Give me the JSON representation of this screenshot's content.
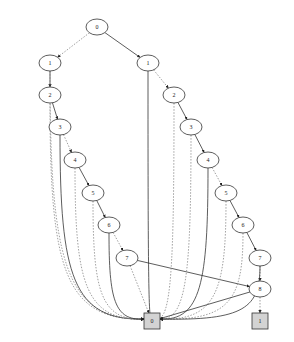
{
  "diagram": {
    "type": "binary-decision-diagram",
    "colors": {
      "edge": "#333333",
      "dashed_edge": "#888888",
      "node_stroke": "#333333",
      "node_fill": "#ffffff",
      "terminal_fill": "#d3d3d3"
    },
    "nodes": [
      {
        "id": "n0",
        "label": "0",
        "x": 97,
        "y": 27,
        "shape": "ellipse"
      },
      {
        "id": "a1",
        "label": "1",
        "x": 50,
        "y": 63,
        "shape": "ellipse"
      },
      {
        "id": "a2",
        "label": "2",
        "x": 50,
        "y": 95,
        "shape": "ellipse"
      },
      {
        "id": "a3",
        "label": "3",
        "x": 60,
        "y": 127,
        "shape": "ellipse"
      },
      {
        "id": "a4",
        "label": "4",
        "x": 75,
        "y": 160,
        "shape": "ellipse"
      },
      {
        "id": "a5",
        "label": "5",
        "x": 93,
        "y": 193,
        "shape": "ellipse"
      },
      {
        "id": "a6",
        "label": "6",
        "x": 109,
        "y": 225,
        "shape": "ellipse"
      },
      {
        "id": "a7",
        "label": "7",
        "x": 127,
        "y": 258,
        "shape": "ellipse"
      },
      {
        "id": "b1",
        "label": "1",
        "x": 148,
        "y": 63,
        "shape": "ellipse"
      },
      {
        "id": "b2",
        "label": "2",
        "x": 174,
        "y": 95,
        "shape": "ellipse"
      },
      {
        "id": "b3",
        "label": "3",
        "x": 191,
        "y": 127,
        "shape": "ellipse"
      },
      {
        "id": "b4",
        "label": "4",
        "x": 208,
        "y": 160,
        "shape": "ellipse"
      },
      {
        "id": "b5",
        "label": "5",
        "x": 226,
        "y": 193,
        "shape": "ellipse"
      },
      {
        "id": "b6",
        "label": "6",
        "x": 243,
        "y": 225,
        "shape": "ellipse"
      },
      {
        "id": "b7",
        "label": "7",
        "x": 260,
        "y": 258,
        "shape": "ellipse"
      },
      {
        "id": "b8",
        "label": "8",
        "x": 260,
        "y": 289,
        "shape": "ellipse"
      },
      {
        "id": "t0",
        "label": "0",
        "x": 152,
        "y": 321,
        "shape": "box"
      },
      {
        "id": "t1",
        "label": "1",
        "x": 260,
        "y": 321,
        "shape": "box"
      }
    ],
    "edges": [
      {
        "from": "n0",
        "to": "a1",
        "style": "dashed"
      },
      {
        "from": "n0",
        "to": "b1",
        "style": "solid"
      },
      {
        "from": "a1",
        "to": "a2",
        "style": "solid"
      },
      {
        "from": "a1",
        "to": "t0",
        "style": "dashed"
      },
      {
        "from": "a2",
        "to": "a3",
        "style": "solid"
      },
      {
        "from": "a2",
        "to": "t0",
        "style": "dashed"
      },
      {
        "from": "a3",
        "to": "a4",
        "style": "dashed"
      },
      {
        "from": "a3",
        "to": "t0",
        "style": "solid"
      },
      {
        "from": "a4",
        "to": "a5",
        "style": "solid"
      },
      {
        "from": "a4",
        "to": "t0",
        "style": "dashed"
      },
      {
        "from": "a5",
        "to": "a6",
        "style": "solid"
      },
      {
        "from": "a5",
        "to": "t0",
        "style": "dashed"
      },
      {
        "from": "a6",
        "to": "a7",
        "style": "dashed"
      },
      {
        "from": "a6",
        "to": "t0",
        "style": "solid"
      },
      {
        "from": "a7",
        "to": "b8",
        "style": "solid"
      },
      {
        "from": "a7",
        "to": "t0",
        "style": "dashed"
      },
      {
        "from": "b1",
        "to": "b2",
        "style": "dashed"
      },
      {
        "from": "b1",
        "to": "t0",
        "style": "solid"
      },
      {
        "from": "b2",
        "to": "b3",
        "style": "solid"
      },
      {
        "from": "b2",
        "to": "t0",
        "style": "dashed"
      },
      {
        "from": "b3",
        "to": "b4",
        "style": "solid"
      },
      {
        "from": "b3",
        "to": "t0",
        "style": "dashed"
      },
      {
        "from": "b4",
        "to": "b5",
        "style": "dashed"
      },
      {
        "from": "b4",
        "to": "t0",
        "style": "solid"
      },
      {
        "from": "b5",
        "to": "b6",
        "style": "solid"
      },
      {
        "from": "b5",
        "to": "t0",
        "style": "dashed"
      },
      {
        "from": "b6",
        "to": "b7",
        "style": "solid"
      },
      {
        "from": "b6",
        "to": "t0",
        "style": "dashed"
      },
      {
        "from": "b7",
        "to": "b8",
        "style": "dashed"
      },
      {
        "from": "b7",
        "to": "t0",
        "style": "solid"
      },
      {
        "from": "b8",
        "to": "t0",
        "style": "solid"
      },
      {
        "from": "b8",
        "to": "t1",
        "style": "dashed"
      }
    ]
  }
}
